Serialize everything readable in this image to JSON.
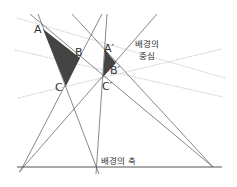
{
  "colors": {
    "line": "#555555",
    "dotted": "#bbbbbb",
    "triangle_fill": "#444444",
    "axis": "#555555"
  },
  "points": {
    "A": {
      "label": "A",
      "x": 43,
      "y": 29
    },
    "B": {
      "label": "B",
      "x": 80,
      "y": 58
    },
    "C": {
      "label": "C",
      "x": 66,
      "y": 86
    },
    "A2": {
      "label": "A′",
      "x": 105,
      "y": 50
    },
    "B2": {
      "label": "B′",
      "x": 116,
      "y": 63
    },
    "C2": {
      "label": "C′",
      "x": 103,
      "y": 77
    },
    "center": {
      "x": 153,
      "y": 67
    }
  },
  "labels": {
    "center_line1": "배경의",
    "center_line2": "중심",
    "axis": "배경의 축"
  },
  "axis": {
    "x1": 17,
    "y1": 167,
    "x2": 222,
    "y2": 167
  },
  "solid_lines": [
    {
      "x1": 30,
      "y1": 14,
      "x2": 213,
      "y2": 167
    },
    {
      "x1": 38,
      "y1": 14,
      "x2": 99,
      "y2": 174
    },
    {
      "x1": 102,
      "y1": 14,
      "x2": 20,
      "y2": 172
    },
    {
      "x1": 72,
      "y1": 14,
      "x2": 213,
      "y2": 167
    },
    {
      "x1": 107,
      "y1": 14,
      "x2": 96,
      "y2": 174
    },
    {
      "x1": 157,
      "y1": 14,
      "x2": 19,
      "y2": 172
    }
  ],
  "dotted_lines": [
    {
      "x1": 17,
      "y1": 18,
      "x2": 225,
      "y2": 78
    },
    {
      "x1": 15,
      "y1": 50,
      "x2": 223,
      "y2": 97
    },
    {
      "x1": 18,
      "y1": 98,
      "x2": 222,
      "y2": 49
    }
  ]
}
